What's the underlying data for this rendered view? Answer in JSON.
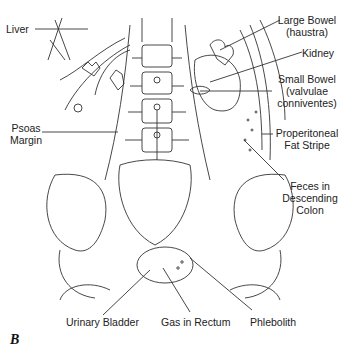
{
  "figure_letter": "B",
  "labels": {
    "liver": "Liver",
    "large_bowel_1": "Large Bowel",
    "large_bowel_2": "(haustra)",
    "kidney": "Kidney",
    "small_bowel_1": "Small Bowel",
    "small_bowel_2": "(valvulae",
    "small_bowel_3": "conniventes)",
    "psoas_1": "Psoas",
    "psoas_2": "Margin",
    "properitoneal_1": "Properitoneal",
    "properitoneal_2": "Fat Stripe",
    "feces_1": "Feces in",
    "feces_2": "Descending",
    "feces_3": "Colon",
    "urinary_bladder": "Urinary Bladder",
    "gas_rectum": "Gas in Rectum",
    "phlebolith": "Phlebolith"
  },
  "colors": {
    "line": "#333333",
    "text": "#222222"
  }
}
